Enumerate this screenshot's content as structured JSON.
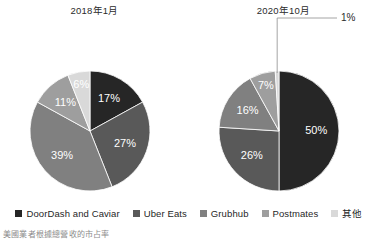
{
  "chart_data": {
    "type": "pie",
    "title": "",
    "legend_position": "bottom",
    "caption": "美國業者根據總營收的市占率",
    "categories": [
      "DoorDash and Caviar",
      "Uber Eats",
      "Grubhub",
      "Postmates",
      "其他"
    ],
    "colors": [
      "#262626",
      "#595959",
      "#808080",
      "#9e9e9e",
      "#d9d9d9"
    ],
    "panels": [
      {
        "title": "2018年1月",
        "values": [
          17,
          27,
          39,
          11,
          6
        ],
        "labels": [
          "17%",
          "27%",
          "39%",
          "11%",
          "6%"
        ],
        "callout": null
      },
      {
        "title": "2020年10月",
        "values": [
          50,
          26,
          16,
          7,
          1
        ],
        "labels": [
          "50%",
          "26%",
          "16%",
          "7%",
          "1%"
        ],
        "callout": {
          "category": "其他",
          "label": "1%"
        }
      }
    ]
  },
  "panels": {
    "left": {
      "title": "2018年1月"
    },
    "right": {
      "title": "2020年10月"
    }
  },
  "legend": {
    "items": [
      {
        "label": "DoorDash and Caviar",
        "color": "#262626"
      },
      {
        "label": "Uber Eats",
        "color": "#595959"
      },
      {
        "label": "Grubhub",
        "color": "#808080"
      },
      {
        "label": "Postmates",
        "color": "#9e9e9e"
      },
      {
        "label": "其他",
        "color": "#d9d9d9"
      }
    ]
  },
  "caption": {
    "text": "美國業者根據總營收的市占率"
  }
}
